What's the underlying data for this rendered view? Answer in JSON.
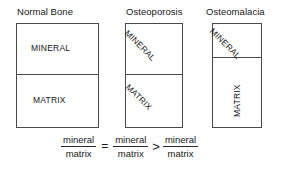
{
  "figure": {
    "background_color": "#ffffff",
    "line_color": "#4a4a4a",
    "text_color": "#171717"
  },
  "panels": [
    {
      "id": "normal-bone",
      "title": "Normal Bone",
      "mineral_label": "MINERAL",
      "matrix_label": "MATRIX",
      "mineral_orientation": "horizontal",
      "matrix_orientation": "horizontal"
    },
    {
      "id": "osteoporosis",
      "title": "Osteoporosis",
      "mineral_label": "MINERAL",
      "matrix_label": "MATRIX",
      "mineral_orientation": "diagonal-45",
      "matrix_orientation": "diagonal-45"
    },
    {
      "id": "osteomalacia",
      "title": "Osteomalacia",
      "mineral_label": "MINERAL",
      "matrix_label": "MATRIX",
      "mineral_orientation": "diagonal-45",
      "matrix_orientation": "vertical-90"
    }
  ],
  "equation": {
    "terms": [
      {
        "numerator": "mineral",
        "denominator": "matrix"
      },
      {
        "numerator": "mineral",
        "denominator": "matrix"
      },
      {
        "numerator": "mineral",
        "denominator": "matrix"
      }
    ],
    "operator_1": "=",
    "operator_2": ">"
  }
}
